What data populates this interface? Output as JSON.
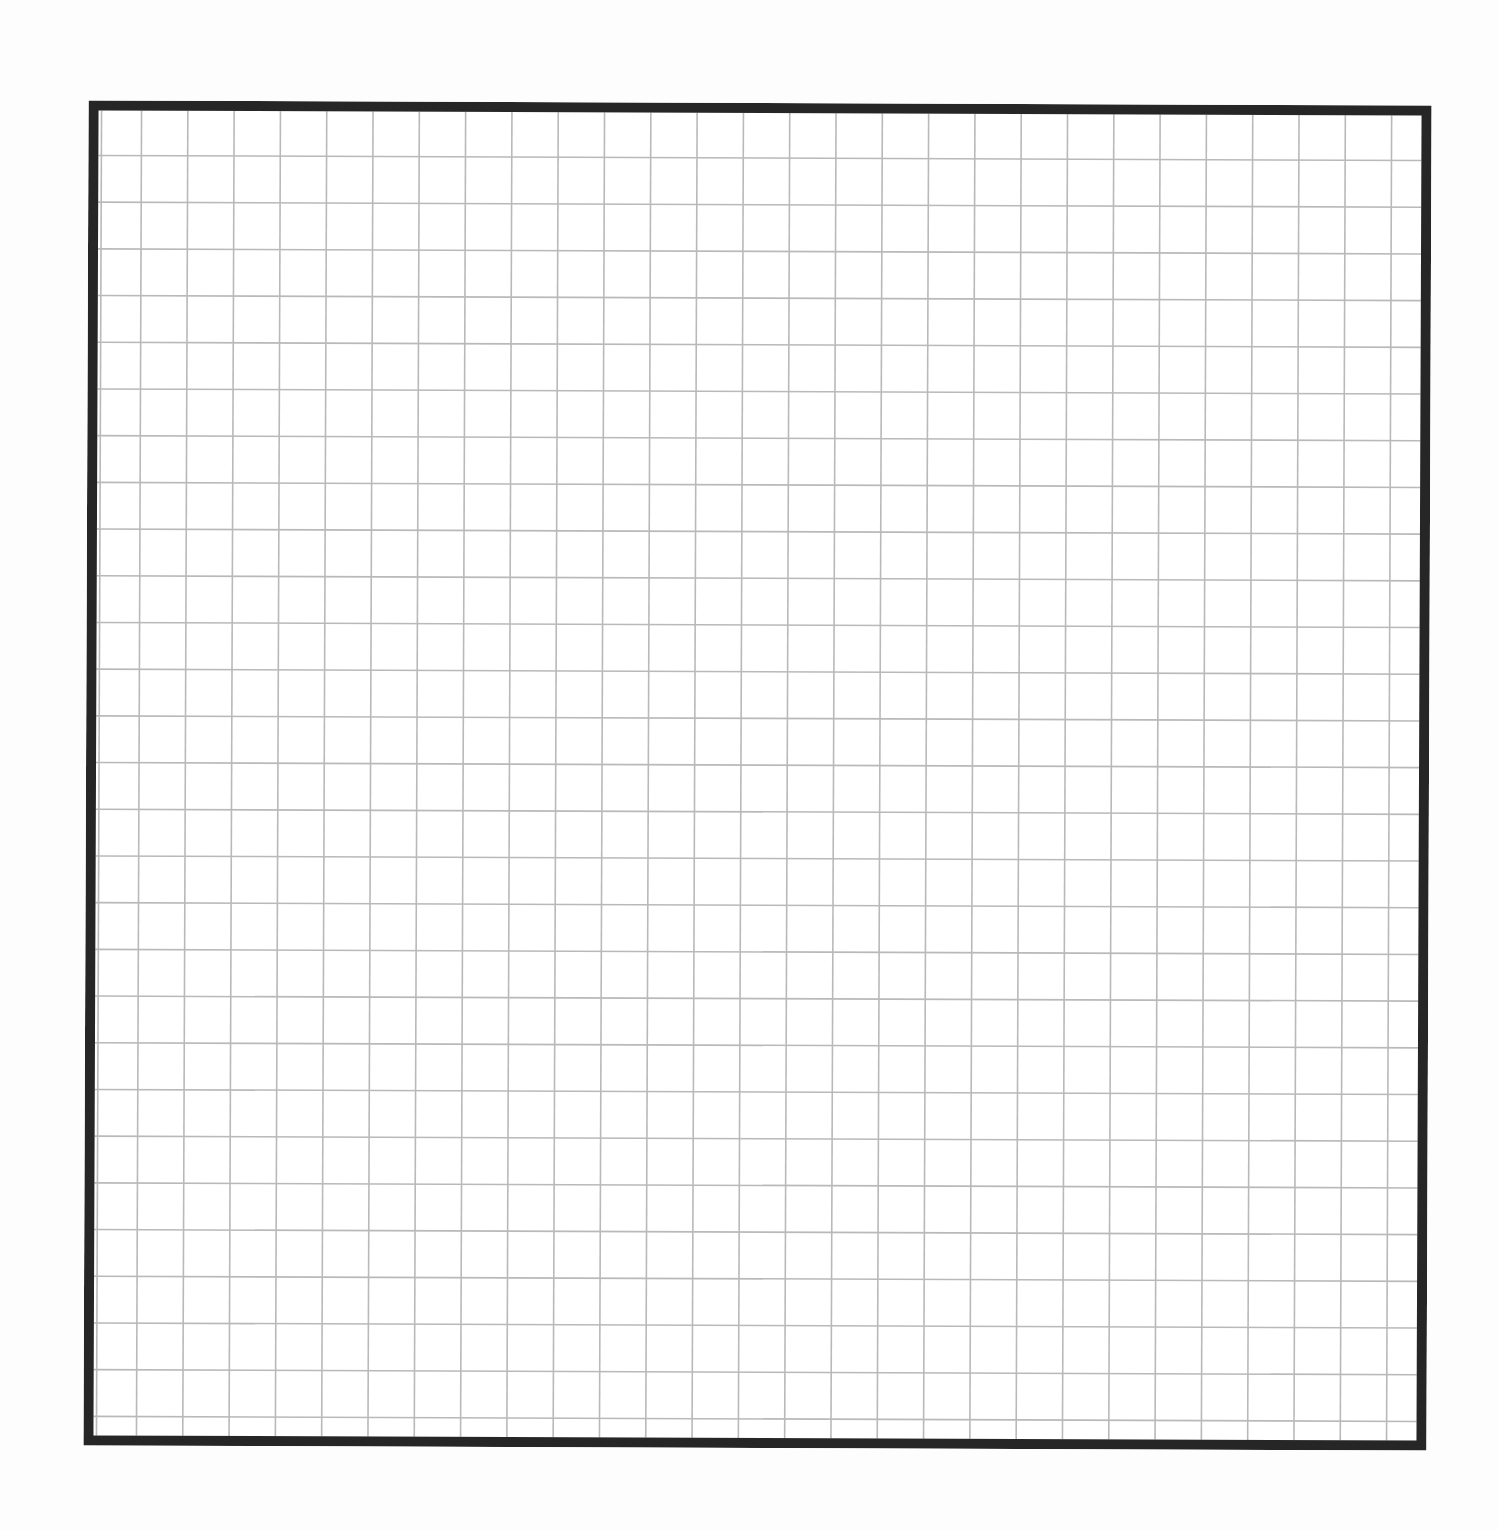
{
  "page": {
    "type": "blank graph paper grid",
    "background_color": "#fdfdfd"
  },
  "grid": {
    "columns": 29,
    "rows": 29,
    "cell_size_px": 46.3,
    "border_width_px": 10,
    "border_color": "#262626",
    "line_color": "#b9b9b9",
    "line_width_px": 1.6
  }
}
